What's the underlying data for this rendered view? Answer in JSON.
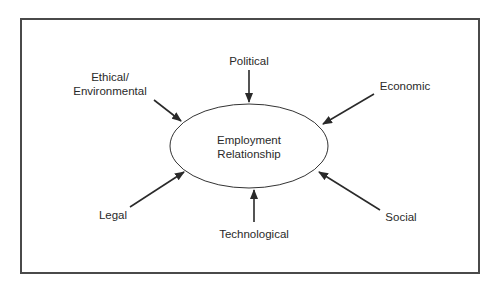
{
  "diagram": {
    "center": {
      "line1": "Employment",
      "line2": "Relationship"
    },
    "factors": [
      {
        "id": "political",
        "label": "Political"
      },
      {
        "id": "economic",
        "label": "Economic"
      },
      {
        "id": "social",
        "label": "Social"
      },
      {
        "id": "technological",
        "label": "Technological"
      },
      {
        "id": "legal",
        "label": "Legal"
      },
      {
        "id": "ethical",
        "line1": "Ethical/",
        "line2": "Environmental"
      }
    ],
    "colors": {
      "line": "#2a2a2a",
      "frame": "#4a4a4a",
      "background": "#ffffff"
    }
  }
}
